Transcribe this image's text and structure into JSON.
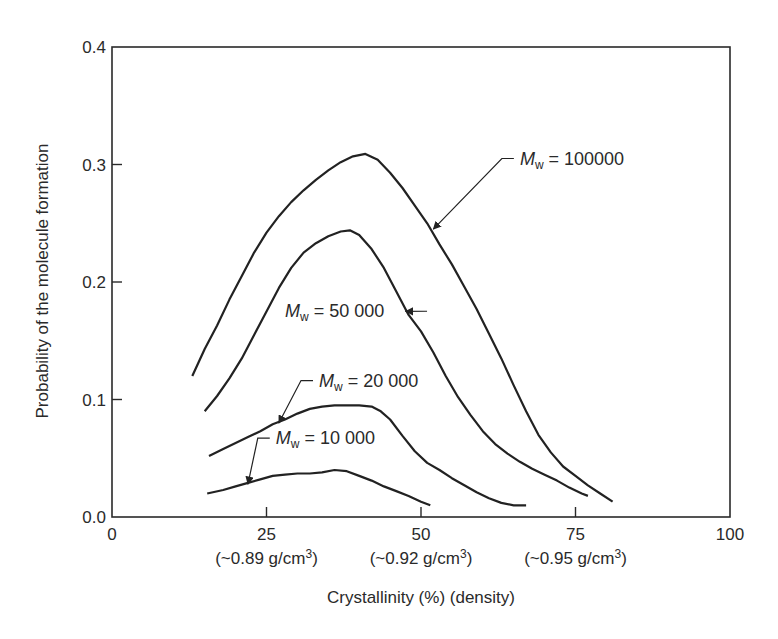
{
  "chart_data": {
    "type": "line",
    "title": "",
    "xlabel": "Crystallinity (%) (density)",
    "ylabel": "Probability of the molecule formation",
    "xlim": [
      0,
      100
    ],
    "ylim": [
      0,
      0.4
    ],
    "grid": false,
    "legend": "none (inline annotations with arrows)",
    "xticks": [
      {
        "value": 0,
        "label": "0",
        "sublabel": ""
      },
      {
        "value": 25,
        "label": "25",
        "sublabel": "(~0.89 g/cm3)"
      },
      {
        "value": 50,
        "label": "50",
        "sublabel": "(~0.92 g/cm3)"
      },
      {
        "value": 75,
        "label": "75",
        "sublabel": "(~0.95 g/cm3)"
      },
      {
        "value": 100,
        "label": "100",
        "sublabel": ""
      }
    ],
    "yticks": [
      {
        "value": 0.0,
        "label": "0.0"
      },
      {
        "value": 0.1,
        "label": "0.1"
      },
      {
        "value": 0.2,
        "label": "0.2"
      },
      {
        "value": 0.3,
        "label": "0.3"
      },
      {
        "value": 0.4,
        "label": "0.4"
      }
    ],
    "series": [
      {
        "name": "Mw = 100000",
        "label_sub": "w",
        "label_value": "100000",
        "x": [
          13,
          15,
          17,
          19,
          21,
          23,
          25,
          27,
          29,
          31,
          33,
          35,
          37,
          39,
          41,
          43,
          45,
          47,
          49,
          51,
          53,
          55,
          57,
          59,
          61,
          63,
          65,
          67,
          69,
          71,
          73,
          75,
          77,
          79,
          81
        ],
        "y": [
          0.12,
          0.143,
          0.163,
          0.185,
          0.205,
          0.225,
          0.242,
          0.256,
          0.268,
          0.278,
          0.287,
          0.295,
          0.302,
          0.307,
          0.309,
          0.304,
          0.293,
          0.28,
          0.265,
          0.25,
          0.232,
          0.215,
          0.196,
          0.177,
          0.156,
          0.135,
          0.112,
          0.09,
          0.07,
          0.055,
          0.043,
          0.035,
          0.027,
          0.02,
          0.013
        ]
      },
      {
        "name": "Mw = 50000",
        "label_sub": "w",
        "label_value": "50 000",
        "x": [
          15,
          17,
          19,
          21,
          23,
          25,
          27,
          29,
          31,
          33,
          35,
          37,
          38.5,
          40,
          42,
          44,
          46,
          48,
          50,
          52,
          54,
          56,
          58,
          60,
          62,
          64,
          66,
          68,
          70,
          72,
          74,
          76,
          77
        ],
        "y": [
          0.09,
          0.103,
          0.118,
          0.135,
          0.155,
          0.175,
          0.195,
          0.212,
          0.225,
          0.233,
          0.239,
          0.243,
          0.244,
          0.24,
          0.228,
          0.212,
          0.192,
          0.172,
          0.158,
          0.14,
          0.12,
          0.102,
          0.087,
          0.073,
          0.062,
          0.054,
          0.047,
          0.041,
          0.036,
          0.031,
          0.025,
          0.02,
          0.018
        ]
      },
      {
        "name": "Mw = 20000",
        "label_sub": "w",
        "label_value": "20 000",
        "x": [
          15.7,
          18,
          20,
          22,
          24,
          26,
          28,
          30,
          32,
          34,
          36,
          38,
          40,
          42,
          43.5,
          45,
          47,
          49,
          51,
          53,
          55,
          57,
          59,
          61,
          63,
          65,
          67
        ],
        "y": [
          0.052,
          0.058,
          0.063,
          0.068,
          0.073,
          0.079,
          0.083,
          0.088,
          0.092,
          0.094,
          0.095,
          0.095,
          0.095,
          0.094,
          0.09,
          0.083,
          0.069,
          0.056,
          0.046,
          0.04,
          0.033,
          0.027,
          0.021,
          0.016,
          0.012,
          0.01,
          0.01
        ]
      },
      {
        "name": "Mw = 10000",
        "label_sub": "w",
        "label_value": "10 000",
        "x": [
          15.4,
          18,
          20,
          22,
          24,
          26,
          28,
          30,
          32,
          34,
          36,
          38,
          40,
          42,
          44,
          46,
          48,
          50,
          51.5
        ],
        "y": [
          0.02,
          0.023,
          0.026,
          0.029,
          0.032,
          0.035,
          0.036,
          0.037,
          0.037,
          0.038,
          0.04,
          0.039,
          0.035,
          0.031,
          0.026,
          0.022,
          0.018,
          0.013,
          0.01
        ]
      }
    ],
    "annotations": [
      {
        "series": "Mw = 100000",
        "text_pos": [
          66,
          0.3
        ],
        "arrow_to": [
          52,
          0.245
        ]
      },
      {
        "series": "Mw = 50000",
        "text_pos": [
          28,
          0.17
        ],
        "arrow_to": [
          47.5,
          0.175
        ]
      },
      {
        "series": "Mw = 20000",
        "text_pos": [
          33.5,
          0.111
        ],
        "arrow_to": [
          27,
          0.08
        ]
      },
      {
        "series": "Mw = 10000",
        "text_pos": [
          26.5,
          0.062
        ],
        "arrow_to": [
          22,
          0.028
        ]
      }
    ]
  }
}
